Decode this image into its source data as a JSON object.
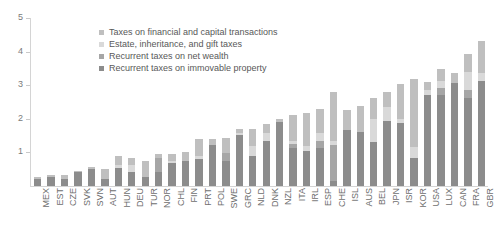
{
  "chart_data": {
    "type": "bar",
    "stacked": true,
    "title": "",
    "subtitle": "",
    "xlabel": "",
    "ylabel": "",
    "ylim": [
      0,
      5
    ],
    "ytick_labels": [
      "0",
      "1",
      "2",
      "3",
      "4",
      "5"
    ],
    "ytick_values": [
      0,
      1,
      2,
      3,
      4,
      5
    ],
    "grid": false,
    "legend_position": "top-center",
    "categories": [
      "MEX",
      "EST",
      "CZE",
      "SVK",
      "SVN",
      "AUT",
      "HUN",
      "DEU",
      "TUR",
      "NOR",
      "CHL",
      "FIN",
      "PRT",
      "POL",
      "SWE",
      "GRC",
      "NLD",
      "DNK",
      "NZL",
      "ITA",
      "IRL",
      "ESP",
      "CHE",
      "ISL",
      "AUS",
      "BEL",
      "JPN",
      "ISR",
      "KOR",
      "USA",
      "LUX",
      "CAN",
      "FRA",
      "GBR"
    ],
    "series": [
      {
        "name": "Recurrent taxes on immovable property",
        "color": "#8c8c8c",
        "values": [
          0.2,
          0.26,
          0.22,
          0.41,
          0.51,
          0.22,
          0.55,
          0.43,
          0.26,
          0.43,
          0.68,
          0.73,
          0.79,
          1.21,
          0.74,
          1.51,
          0.88,
          1.35,
          1.92,
          1.12,
          1.04,
          1.14,
          0.16,
          1.67,
          1.62,
          1.32,
          1.94,
          1.89,
          0.83,
          2.72,
          2.72,
          3.07,
          2.63,
          3.12
        ]
      },
      {
        "name": "Recurrent taxes on net wealth",
        "color": "#a6a6a6",
        "values": [
          0.0,
          0.0,
          0.0,
          0.0,
          0.0,
          0.0,
          0.0,
          0.0,
          0.0,
          0.39,
          0.0,
          0.0,
          0.0,
          0.0,
          0.25,
          0.0,
          0.0,
          0.0,
          0.0,
          0.14,
          0.0,
          0.21,
          1.07,
          0.0,
          0.0,
          0.0,
          0.0,
          0.0,
          0.0,
          0.0,
          0.19,
          0.0,
          0.24,
          0.0
        ]
      },
      {
        "name": "Estate, inheritance, and gift taxes",
        "color": "#d9d9d9",
        "values": [
          0.0,
          0.0,
          0.0,
          0.0,
          0.0,
          0.0,
          0.09,
          0.2,
          0.0,
          0.0,
          0.05,
          0.0,
          0.1,
          0.0,
          0.0,
          0.06,
          0.3,
          0.23,
          0.0,
          0.07,
          0.16,
          0.22,
          0.1,
          0.0,
          0.0,
          0.67,
          0.4,
          0.11,
          0.32,
          0.15,
          0.23,
          0.0,
          0.51,
          0.25
        ]
      },
      {
        "name": "Taxes on financial and capital transactions",
        "color": "#bfbfbf",
        "values": [
          0.06,
          0.08,
          0.11,
          0.04,
          0.06,
          0.3,
          0.26,
          0.2,
          0.49,
          0.14,
          0.22,
          0.27,
          0.52,
          0.2,
          0.45,
          0.13,
          0.52,
          0.28,
          0.08,
          0.78,
          0.96,
          0.71,
          1.46,
          0.6,
          0.76,
          0.63,
          0.45,
          1.05,
          2.05,
          0.23,
          0.35,
          0.29,
          0.54,
          0.94
        ]
      }
    ]
  },
  "legend": {
    "items": [
      {
        "label": "Taxes on financial and capital transactions",
        "color": "#bfbfbf"
      },
      {
        "label": "Estate, inheritance, and gift taxes",
        "color": "#d9d9d9"
      },
      {
        "label": "Recurrent taxes on net wealth",
        "color": "#a6a6a6"
      },
      {
        "label": "Recurrent taxes on immovable property",
        "color": "#8c8c8c"
      }
    ]
  },
  "axis": {
    "y_labels": [
      "5",
      "4",
      "3",
      "2",
      "1"
    ],
    "axis_color": "#d4d4d4",
    "tick_text_color": "#7a7a7a"
  }
}
